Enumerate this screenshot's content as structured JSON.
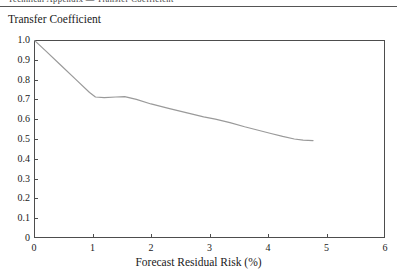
{
  "header": {
    "running_head": "Technical Appendix — Transfer Coefficient",
    "rule_color": "#555555"
  },
  "chart_data": {
    "type": "line",
    "title": "",
    "ylabel": "Transfer Coefficient",
    "xlabel": "Forecast Residual Risk (%)",
    "xlim": [
      0,
      6
    ],
    "ylim": [
      0,
      1.0
    ],
    "grid": false,
    "legend": "none",
    "line_color": "#9a9a9a",
    "axis_color": "#4d4d4d",
    "xticks": [
      0,
      1,
      2,
      3,
      4,
      5,
      6
    ],
    "xtick_labels": [
      "0",
      "1",
      "2",
      "3",
      "4",
      "5",
      "6"
    ],
    "yticks": [
      0,
      0.1,
      0.2,
      0.3,
      0.4,
      0.5,
      0.6,
      0.7,
      0.8,
      0.9,
      1.0
    ],
    "ytick_labels": [
      "0",
      "0.1",
      "0.2",
      "0.3",
      "0.4",
      "0.5",
      "0.6",
      "0.7",
      "0.8",
      "0.9",
      "1.0"
    ],
    "series": [
      {
        "name": "Transfer Coefficient",
        "x": [
          0.0,
          0.2,
          0.45,
          0.7,
          0.95,
          1.05,
          1.2,
          1.4,
          1.55,
          1.75,
          2.0,
          2.3,
          2.6,
          2.9,
          3.1,
          3.35,
          3.6,
          3.85,
          4.05,
          4.25,
          4.45,
          4.6,
          4.77
        ],
        "y": [
          1.0,
          0.945,
          0.875,
          0.805,
          0.735,
          0.712,
          0.709,
          0.712,
          0.714,
          0.7,
          0.677,
          0.655,
          0.633,
          0.612,
          0.6,
          0.583,
          0.562,
          0.543,
          0.528,
          0.513,
          0.5,
          0.494,
          0.492
        ]
      }
    ]
  }
}
